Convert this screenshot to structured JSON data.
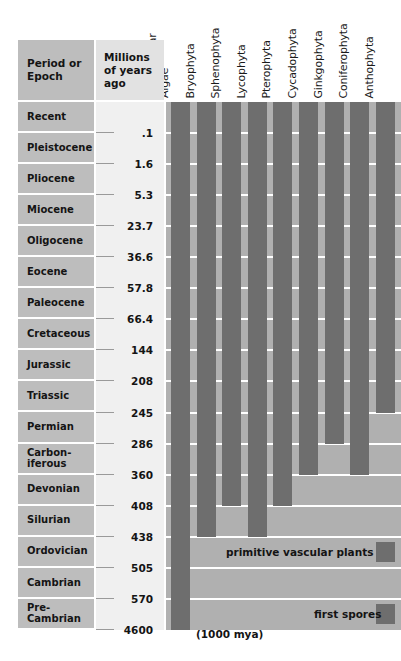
{
  "table": {
    "col_headers": {
      "period": "Period or\nEpoch",
      "mya": "Millions of\nyears ago"
    },
    "taxa": [
      "Multicellular\nAlgae",
      "Bryophyta",
      "Sphenophyta",
      "Lycophyta",
      "Pterophyta",
      "Cycadophyta",
      "Ginkgophyta",
      "Coniferophyta",
      "Anthophyta"
    ],
    "periods": [
      "Recent",
      "Pleistocene",
      "Pliocene",
      "Miocene",
      "Oligocene",
      "Eocene",
      "Paleocene",
      "Cretaceous",
      "Jurassic",
      "Triassic",
      "Permian",
      "Carbon-\niferous",
      "Devonian",
      "Silurian",
      "Ordovician",
      "Cambrian",
      "Pre-\nCambrian"
    ],
    "boundaries": [
      ".1",
      "1.6",
      "5.3",
      "23.7",
      "36.6",
      "57.8",
      "66.4",
      "144",
      "208",
      "245",
      "286",
      "360",
      "408",
      "438",
      "505",
      "570",
      "4600"
    ]
  },
  "annotations": {
    "primitive_vascular": "primitive vascular plants",
    "first_spores": "first spores",
    "origin_note": "(1000 mya)"
  },
  "colors": {
    "bar": "#6e6e6e",
    "panel": "#b0b0b0",
    "period_bg": "#bdbdbd",
    "mya_bg": "#f0f0f0",
    "header_period_bg": "#bdbdbd",
    "header_mya_bg": "#e2e2e2",
    "grid": "#ffffff",
    "text": "#141414"
  },
  "chart_data": {
    "type": "bar",
    "xlabel": "Plant divisions",
    "ylabel": "Millions of years ago",
    "orientation": "vertical-time-ranges",
    "grid": true,
    "legend": "none",
    "categories": [
      "Multicellular Algae",
      "Bryophyta",
      "Sphenophyta",
      "Lycophyta",
      "Pterophyta",
      "Cycadophyta",
      "Ginkgophyta",
      "Coniferophyta",
      "Anthophyta"
    ],
    "time_axis": {
      "unit": "million years ago",
      "boundaries_mya": [
        0,
        0.1,
        1.6,
        5.3,
        23.7,
        36.6,
        57.8,
        66.4,
        144,
        208,
        245,
        286,
        360,
        408,
        438,
        505,
        570,
        4600
      ],
      "period_names": [
        "Recent",
        "Pleistocene",
        "Pliocene",
        "Miocene",
        "Oligocene",
        "Eocene",
        "Paleocene",
        "Cretaceous",
        "Jurassic",
        "Triassic",
        "Permian",
        "Carboniferous",
        "Devonian",
        "Silurian",
        "Ordovician",
        "Cambrian",
        "Pre-Cambrian"
      ]
    },
    "ranges": [
      {
        "name": "Multicellular Algae",
        "first_appearance_period": "Pre-Cambrian",
        "first_appearance_mya": 1000,
        "still_extant": true,
        "bar_start_row": 16,
        "bar_end_row": 0
      },
      {
        "name": "Bryophyta",
        "first_appearance_period": "Silurian",
        "first_appearance_mya": 438,
        "still_extant": true,
        "bar_start_row": 13,
        "bar_end_row": 0
      },
      {
        "name": "Sphenophyta",
        "first_appearance_period": "Devonian",
        "first_appearance_mya": 408,
        "still_extant": true,
        "bar_start_row": 12,
        "bar_end_row": 0
      },
      {
        "name": "Lycophyta",
        "first_appearance_period": "Silurian",
        "first_appearance_mya": 438,
        "still_extant": true,
        "bar_start_row": 13,
        "bar_end_row": 0
      },
      {
        "name": "Pterophyta",
        "first_appearance_period": "Devonian",
        "first_appearance_mya": 408,
        "still_extant": true,
        "bar_start_row": 12,
        "bar_end_row": 0
      },
      {
        "name": "Cycadophyta",
        "first_appearance_period": "Carboniferous",
        "first_appearance_mya": 360,
        "still_extant": true,
        "bar_start_row": 11,
        "bar_end_row": 0
      },
      {
        "name": "Ginkgophyta",
        "first_appearance_period": "Permian",
        "first_appearance_mya": 286,
        "still_extant": true,
        "bar_start_row": 10,
        "bar_end_row": 0
      },
      {
        "name": "Coniferophyta",
        "first_appearance_period": "Carboniferous",
        "first_appearance_mya": 360,
        "still_extant": true,
        "bar_start_row": 11,
        "bar_end_row": 0
      },
      {
        "name": "Anthophyta",
        "first_appearance_period": "Jurassic",
        "first_appearance_mya": 208,
        "still_extant": true,
        "bar_start_row": 9,
        "bar_end_row": 0
      }
    ],
    "annotations": [
      {
        "text": "primitive vascular plants",
        "row_period": "Ordovician"
      },
      {
        "text": "first spores",
        "row_period": "Pre-Cambrian"
      },
      {
        "text": "(1000 mya)",
        "row_period": "Pre-Cambrian"
      }
    ]
  }
}
